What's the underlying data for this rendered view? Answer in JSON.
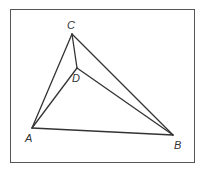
{
  "diagram": {
    "type": "geometry",
    "frame": {
      "x": 10,
      "y": 9,
      "width": 184,
      "height": 153,
      "stroke": "#555555"
    },
    "line_color": "#333333",
    "points": {
      "A": {
        "x": 32,
        "y": 128,
        "label": "A",
        "label_x": 25,
        "label_y": 142
      },
      "B": {
        "x": 173,
        "y": 135,
        "label": "B",
        "label_x": 174,
        "label_y": 149
      },
      "C": {
        "x": 72,
        "y": 34,
        "label": "C",
        "label_x": 67,
        "label_y": 29
      },
      "D": {
        "x": 77,
        "y": 68,
        "label": "D",
        "label_x": 72,
        "label_y": 82
      }
    },
    "segments": [
      [
        "A",
        "B"
      ],
      [
        "B",
        "C"
      ],
      [
        "C",
        "A"
      ],
      [
        "A",
        "D"
      ],
      [
        "B",
        "D"
      ],
      [
        "C",
        "D"
      ]
    ]
  }
}
